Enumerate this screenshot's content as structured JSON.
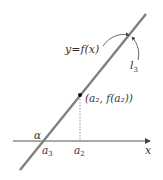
{
  "diagram": {
    "curve_label": "y=f(x)",
    "line_label": "l",
    "line_label_sub": "3",
    "point_label": "(a₂, f(a₂))",
    "angle_label": "α",
    "x_intercept_label": "a",
    "x_intercept_sub": "3",
    "foot_label": "a",
    "foot_sub": "2",
    "axis_label": "x",
    "colors": {
      "line": "#808080",
      "axis": "#555555",
      "text": "#333333",
      "point": "#111111"
    }
  }
}
